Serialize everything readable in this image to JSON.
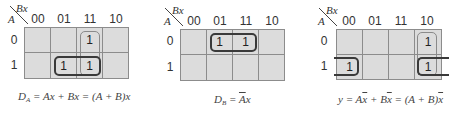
{
  "colors": {
    "cell_fill": "#dcdcdc",
    "grid_line": "#8c8c8c",
    "loop_dark": "#3a3a3a",
    "loop_light": "#8a8a8a"
  },
  "maps": [
    {
      "row_var": "A",
      "col_var": "Bx",
      "col_labels": [
        "00",
        "01",
        "11",
        "10"
      ],
      "row_labels": [
        "0",
        "1"
      ],
      "cells": [
        [
          "",
          "",
          "1",
          ""
        ],
        [
          "",
          "1",
          "1",
          ""
        ]
      ],
      "groups": [
        {
          "cells": [
            "0-11",
            "1-11"
          ],
          "orientation": "vertical"
        },
        {
          "cells": [
            "1-01",
            "1-11"
          ],
          "orientation": "horizontal"
        }
      ],
      "equation": {
        "lhs": "D",
        "lhs_sub": "A",
        "rhs": " = Ax + Bx = (A + B)x"
      }
    },
    {
      "row_var": "A",
      "col_var": "Bx",
      "col_labels": [
        "00",
        "01",
        "11",
        "10"
      ],
      "row_labels": [
        "0",
        "1"
      ],
      "cells": [
        [
          "",
          "1",
          "1",
          ""
        ],
        [
          "",
          "",
          "",
          ""
        ]
      ],
      "groups": [
        {
          "cells": [
            "0-01",
            "0-11"
          ],
          "orientation": "horizontal"
        }
      ],
      "equation": {
        "lhs": "D",
        "lhs_sub": "B",
        "eq": " = ",
        "bar_term": "A",
        "rest": "x"
      }
    },
    {
      "row_var": "A",
      "col_var": "Bx",
      "col_labels": [
        "00",
        "01",
        "11",
        "10"
      ],
      "row_labels": [
        "0",
        "1"
      ],
      "cells": [
        [
          "",
          "",
          "",
          "1"
        ],
        [
          "1",
          "",
          "",
          "1"
        ]
      ],
      "groups": [
        {
          "cells": [
            "0-10",
            "1-10"
          ],
          "orientation": "vertical"
        },
        {
          "cells": [
            "1-10",
            "1-00"
          ],
          "orientation": "wrap-around"
        }
      ],
      "equation": {
        "p1": "y = A",
        "x1": "x",
        "p2": " + B",
        "x2": "x",
        "p3": " = (A + B)",
        "x3": "x"
      }
    }
  ]
}
